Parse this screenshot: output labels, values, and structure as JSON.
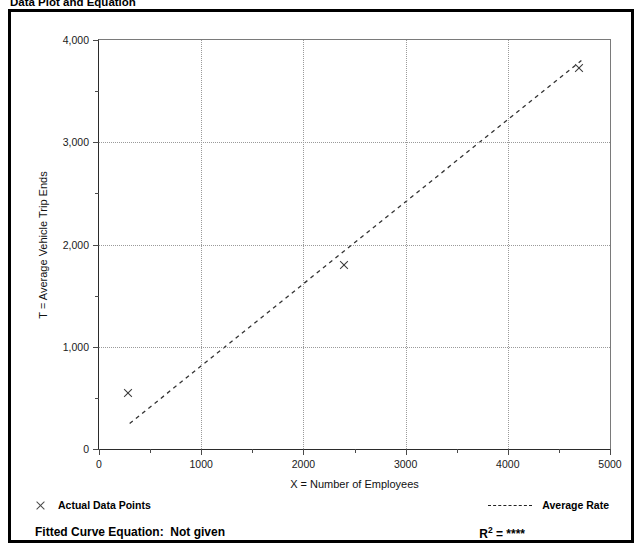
{
  "header": {
    "title": "Data Plot and Equation",
    "meta": ""
  },
  "legend": {
    "data_points_label": "Actual Data Points",
    "average_rate_label": "Average Rate",
    "data_marker_icon": "x-marker-icon",
    "rate_marker_icon": "dashed-line-icon"
  },
  "footer": {
    "equation_label": "Fitted Curve Equation:",
    "equation_value": "Not given",
    "r2_prefix": "R",
    "r2_exponent": "2",
    "r2_equals": "=",
    "r2_value": "****"
  },
  "chart_data": {
    "type": "scatter",
    "title": "Data Plot and Equation",
    "xlabel": "X = Number of Employees",
    "ylabel": "T = Average Vehicle Trip Ends",
    "xlim": [
      0,
      5000
    ],
    "ylim": [
      0,
      4000
    ],
    "xticks": [
      0,
      1000,
      2000,
      3000,
      4000,
      5000
    ],
    "xtick_labels": [
      "0",
      "1000",
      "2000",
      "3000",
      "4000",
      "5000"
    ],
    "yticks": [
      0,
      1000,
      2000,
      3000,
      4000
    ],
    "ytick_labels": [
      "0",
      "1,000",
      "2,000",
      "3,000",
      "4,000"
    ],
    "x_minor_ticks": [
      500,
      1500,
      2500,
      3500,
      4500
    ],
    "y_minor_ticks": [
      500,
      1500,
      2500,
      3500
    ],
    "grid": true,
    "grid_style": "dotted",
    "legend_position": "below-plot",
    "series": [
      {
        "name": "Actual Data Points",
        "type": "scatter",
        "marker": "x",
        "points": [
          {
            "x": 280,
            "y": 550
          },
          {
            "x": 2400,
            "y": 1800
          },
          {
            "x": 4700,
            "y": 3730
          }
        ]
      },
      {
        "name": "Average Rate",
        "type": "line",
        "style": "dashed",
        "points": [
          {
            "x": 300,
            "y": 250
          },
          {
            "x": 4720,
            "y": 3800
          }
        ]
      }
    ]
  }
}
